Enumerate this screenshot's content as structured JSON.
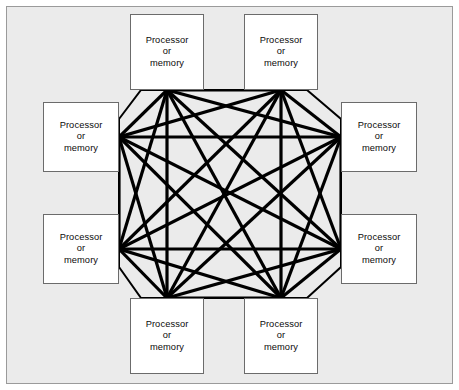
{
  "figure": {
    "kind": "fully-connected-network-diagram",
    "frame": {
      "background_color": "#ebebeb",
      "border_color": "#9a9a9a"
    },
    "switch_region": {
      "name": "interconnect-octagon",
      "fill_color": "#ebebeb",
      "outline_color": "#000000",
      "link_color": "#000000",
      "link_count": 28,
      "shape": "octagon"
    }
  },
  "node_label": {
    "line1": "Processor",
    "line2": "or",
    "line3": "memory"
  },
  "nodes": [
    {
      "id": "node-top-left",
      "label_lines": [
        "Processor",
        "or",
        "memory"
      ],
      "position": "top-left",
      "x": 130,
      "y": 14,
      "w": 74,
      "h": 76
    },
    {
      "id": "node-top-right",
      "label_lines": [
        "Processor",
        "or",
        "memory"
      ],
      "position": "top-right",
      "x": 244,
      "y": 14,
      "w": 74,
      "h": 76
    },
    {
      "id": "node-left-upper",
      "label_lines": [
        "Processor",
        "or",
        "memory"
      ],
      "position": "left-upper",
      "x": 43,
      "y": 102,
      "w": 76,
      "h": 70
    },
    {
      "id": "node-right-upper",
      "label_lines": [
        "Processor",
        "or",
        "memory"
      ],
      "position": "right-upper",
      "x": 341,
      "y": 102,
      "w": 76,
      "h": 70
    },
    {
      "id": "node-left-lower",
      "label_lines": [
        "Processor",
        "or",
        "memory"
      ],
      "position": "left-lower",
      "x": 43,
      "y": 214,
      "w": 76,
      "h": 70
    },
    {
      "id": "node-right-lower",
      "label_lines": [
        "Processor",
        "or",
        "memory"
      ],
      "position": "right-lower",
      "x": 341,
      "y": 214,
      "w": 76,
      "h": 70
    },
    {
      "id": "node-bottom-left",
      "label_lines": [
        "Processor",
        "or",
        "memory"
      ],
      "position": "bottom-left",
      "x": 130,
      "y": 298,
      "w": 74,
      "h": 76
    },
    {
      "id": "node-bottom-right",
      "label_lines": [
        "Processor",
        "or",
        "memory"
      ],
      "position": "bottom-right",
      "x": 244,
      "y": 298,
      "w": 74,
      "h": 76
    }
  ],
  "chart_data": {
    "type": "diagram",
    "node_count": 8,
    "edge_count": 28,
    "node_label": "Processor or memory",
    "ports": [
      {
        "id": "p-top-left",
        "x": 167,
        "y": 90,
        "side": "top"
      },
      {
        "id": "p-top-right",
        "x": 281,
        "y": 90,
        "side": "top"
      },
      {
        "id": "p-left-upper",
        "x": 119,
        "y": 137,
        "side": "left"
      },
      {
        "id": "p-right-upper",
        "x": 341,
        "y": 137,
        "side": "right"
      },
      {
        "id": "p-left-lower",
        "x": 119,
        "y": 249,
        "side": "left"
      },
      {
        "id": "p-right-lower",
        "x": 341,
        "y": 249,
        "side": "right"
      },
      {
        "id": "p-bottom-left",
        "x": 167,
        "y": 298,
        "side": "bottom"
      },
      {
        "id": "p-bottom-right",
        "x": 281,
        "y": 298,
        "side": "bottom"
      }
    ],
    "edges": [
      [
        "p-top-left",
        "p-top-right"
      ],
      [
        "p-top-left",
        "p-left-upper"
      ],
      [
        "p-top-left",
        "p-right-upper"
      ],
      [
        "p-top-left",
        "p-left-lower"
      ],
      [
        "p-top-left",
        "p-right-lower"
      ],
      [
        "p-top-left",
        "p-bottom-left"
      ],
      [
        "p-top-left",
        "p-bottom-right"
      ],
      [
        "p-top-right",
        "p-left-upper"
      ],
      [
        "p-top-right",
        "p-right-upper"
      ],
      [
        "p-top-right",
        "p-left-lower"
      ],
      [
        "p-top-right",
        "p-right-lower"
      ],
      [
        "p-top-right",
        "p-bottom-left"
      ],
      [
        "p-top-right",
        "p-bottom-right"
      ],
      [
        "p-left-upper",
        "p-right-upper"
      ],
      [
        "p-left-upper",
        "p-left-lower"
      ],
      [
        "p-left-upper",
        "p-right-lower"
      ],
      [
        "p-left-upper",
        "p-bottom-left"
      ],
      [
        "p-left-upper",
        "p-bottom-right"
      ],
      [
        "p-right-upper",
        "p-left-lower"
      ],
      [
        "p-right-upper",
        "p-right-lower"
      ],
      [
        "p-right-upper",
        "p-bottom-left"
      ],
      [
        "p-right-upper",
        "p-bottom-right"
      ],
      [
        "p-left-lower",
        "p-right-lower"
      ],
      [
        "p-left-lower",
        "p-bottom-left"
      ],
      [
        "p-left-lower",
        "p-bottom-right"
      ],
      [
        "p-right-lower",
        "p-bottom-left"
      ],
      [
        "p-right-lower",
        "p-bottom-right"
      ],
      [
        "p-bottom-left",
        "p-bottom-right"
      ]
    ],
    "octagon_points": [
      [
        119,
        119
      ],
      [
        141,
        90
      ],
      [
        307,
        90
      ],
      [
        341,
        119
      ],
      [
        341,
        267
      ],
      [
        307,
        298
      ],
      [
        141,
        298
      ],
      [
        119,
        267
      ]
    ],
    "link_stroke_width": 3.2,
    "link_color": "#000000"
  }
}
